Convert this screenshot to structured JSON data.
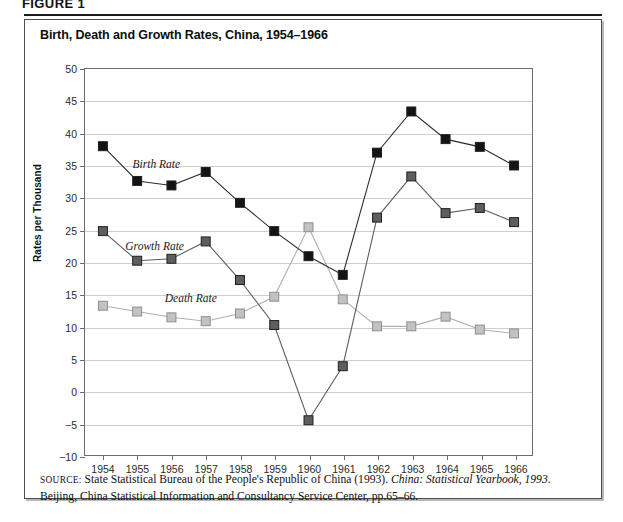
{
  "figure": {
    "number_label": "FIGURE 1",
    "title": "Birth, Death and Growth Rates, China, 1954–1966"
  },
  "source": {
    "prefix": "SOURCE:",
    "text_before_italic": " State Statistical Bureau of the People's Republic of China (1993). ",
    "italic_title": "China: Statistical Yearbook, 1993",
    "text_after_italic": ". Beijing, China Statistical Information and Consultancy Service Center, pp.65–66."
  },
  "chart_data": {
    "type": "line",
    "title": "Birth, Death and Growth Rates, China, 1954–1966",
    "xlabel": "",
    "ylabel": "Rates per Thousand",
    "x": [
      1954,
      1955,
      1956,
      1957,
      1958,
      1959,
      1960,
      1961,
      1962,
      1963,
      1964,
      1965,
      1966
    ],
    "xtick_labels": [
      "1954",
      "1955",
      "1956",
      "1957",
      "1958",
      "1959",
      "1960",
      "1961",
      "1962",
      "1963",
      "1964",
      "1965",
      "1966"
    ],
    "ylim": [
      -10,
      50
    ],
    "yticks": [
      -10,
      -5,
      0,
      5,
      10,
      15,
      20,
      25,
      30,
      35,
      40,
      45,
      50
    ],
    "ytick_labels": [
      "−10",
      "−5",
      "0",
      "5",
      "10",
      "15",
      "20",
      "25",
      "30",
      "35",
      "40",
      "45",
      "50"
    ],
    "grid": true,
    "legend_position": "inline-annotations",
    "series": [
      {
        "name": "Birth Rate",
        "label": "Birth Rate",
        "color": "#141414",
        "marker": "square-filled-black",
        "label_x": 1955.55,
        "label_y": 35.3,
        "values": [
          38.0,
          32.6,
          31.9,
          34.0,
          29.2,
          24.8,
          20.9,
          18.0,
          37.0,
          43.4,
          39.1,
          37.9,
          35.0
        ]
      },
      {
        "name": "Growth Rate",
        "label": "Growth Rate",
        "color": "#5e5e5e",
        "marker": "square-filled-gray",
        "label_x": 1955.5,
        "label_y": 22.6,
        "values": [
          24.8,
          20.2,
          20.5,
          23.2,
          17.2,
          10.2,
          -4.6,
          3.8,
          26.9,
          33.3,
          27.6,
          28.4,
          26.2
        ]
      },
      {
        "name": "Death Rate",
        "label": "Death Rate",
        "color": "#c2c2c2",
        "marker": "square-filled-light",
        "label_x": 1956.55,
        "label_y": 14.6,
        "values": [
          13.2,
          12.3,
          11.4,
          10.8,
          12.0,
          14.6,
          25.4,
          14.2,
          10.0,
          10.0,
          11.5,
          9.5,
          8.9
        ]
      }
    ]
  },
  "colors": {
    "birth": "#141414",
    "growth": "#5e5e5e",
    "death": "#c2c2c2",
    "grid": "#cfcfcf",
    "axis": "#6d6d6d",
    "frame": "#4c4c4c"
  }
}
